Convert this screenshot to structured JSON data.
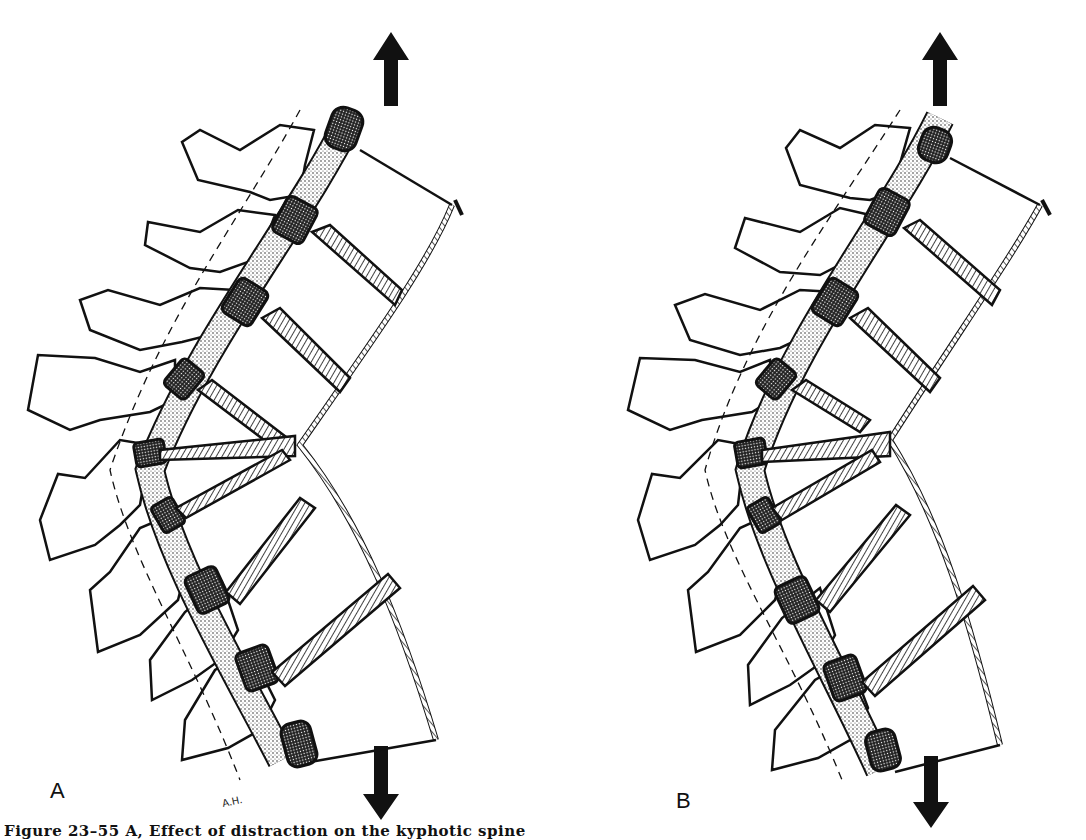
{
  "figure": {
    "panels": [
      {
        "id": "A",
        "label": "A",
        "arrows": {
          "top": "up-arrow",
          "bottom": "down-arrow"
        }
      },
      {
        "id": "B",
        "label": "B",
        "arrows": {
          "top": "up-arrow",
          "bottom": "down-arrow"
        }
      }
    ],
    "artist_initials": "A.H.",
    "caption": "Figure 23–55  A, Effect of distraction on the kyphotic spine"
  },
  "colors": {
    "ink": "#111111",
    "paper": "#ffffff",
    "stipple": "#555555"
  }
}
